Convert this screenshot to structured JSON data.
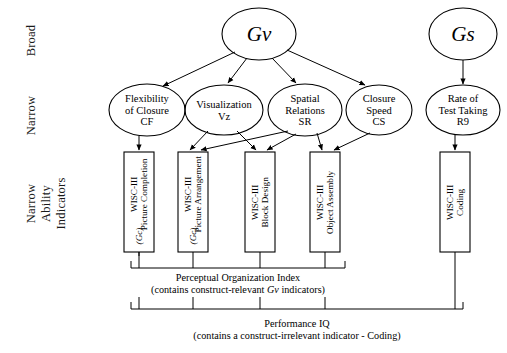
{
  "figure": {
    "type": "hierarchical-factor-diagram",
    "width": 507,
    "height": 353,
    "background": "#ffffff",
    "line_color": "#000000"
  },
  "layer_labels": [
    {
      "id": "broad",
      "text": "Broad"
    },
    {
      "id": "narrow",
      "text": "Narrow"
    },
    {
      "id": "indicators_line1",
      "text": "Narrow"
    },
    {
      "id": "indicators_line2",
      "text": "Ability"
    },
    {
      "id": "indicators_line3",
      "text": "Indicators"
    }
  ],
  "broad_factors": [
    {
      "id": "gv",
      "label": "Gv",
      "cx": 259,
      "cy": 34,
      "rx": 37,
      "ry": 26
    },
    {
      "id": "gs",
      "label": "Gs",
      "cx": 463,
      "cy": 34,
      "rx": 34,
      "ry": 26
    }
  ],
  "narrow_factors": [
    {
      "id": "cf",
      "lines": [
        "Flexibility",
        "of Closure",
        "CF"
      ],
      "cx": 147,
      "cy": 110,
      "rx": 38,
      "ry": 26
    },
    {
      "id": "vz",
      "lines": [
        "Visualization",
        "Vz"
      ],
      "cx": 224,
      "cy": 110,
      "rx": 39,
      "ry": 25
    },
    {
      "id": "sr",
      "lines": [
        "Spatial",
        "Relations",
        "SR"
      ],
      "cx": 305,
      "cy": 110,
      "rx": 37,
      "ry": 26
    },
    {
      "id": "cs",
      "lines": [
        "Closure",
        "Speed",
        "CS"
      ],
      "cx": 379,
      "cy": 110,
      "rx": 33,
      "ry": 25
    },
    {
      "id": "r9",
      "lines": [
        "Rate of",
        "Test Taking",
        "R9"
      ],
      "cx": 463,
      "cy": 110,
      "rx": 37,
      "ry": 25
    }
  ],
  "indicator_boxes": [
    {
      "id": "picture-completion",
      "line1": "WISC-III",
      "line2": "Picture Completion",
      "note": "(Gc)",
      "x": 124,
      "y": 152,
      "w": 30,
      "h": 100
    },
    {
      "id": "picture-arrangement",
      "line1": "WISC-III",
      "line2": "Picture Arrangement",
      "note": "(Gc)",
      "x": 178,
      "y": 152,
      "w": 30,
      "h": 100
    },
    {
      "id": "block-design",
      "line1": "WISC-III",
      "line2": "Block Design",
      "note": "",
      "x": 245,
      "y": 152,
      "w": 30,
      "h": 100
    },
    {
      "id": "object-assembly",
      "line1": "WISC-III",
      "line2": "Object Assembly",
      "note": "",
      "x": 310,
      "y": 152,
      "w": 30,
      "h": 100
    },
    {
      "id": "coding",
      "line1": "WISC-III",
      "line2": "Coding",
      "note": "",
      "x": 440,
      "y": 152,
      "w": 30,
      "h": 100
    }
  ],
  "brackets": [
    {
      "id": "perceptual-organization-index",
      "caption_line1": "Perceptual Organization Index",
      "caption_line2_pre": "(contains construct-relevant ",
      "caption_line2_em": "Gv",
      "caption_line2_post": " indicators)",
      "x1": 131,
      "x2": 345,
      "y": 268,
      "ticks": [
        139,
        193,
        260,
        325
      ]
    },
    {
      "id": "performance-iq",
      "caption_line1": "Performance  IQ",
      "caption_line2_pre": "(contains a construct-irrelevant indicator - Coding)",
      "caption_line2_em": "",
      "caption_line2_post": "",
      "x1": 131,
      "x2": 463,
      "y": 309,
      "ticks": [
        139,
        193,
        260,
        325,
        455
      ]
    }
  ],
  "edges": [
    {
      "from": "gv",
      "to": "cf"
    },
    {
      "from": "gv",
      "to": "vz"
    },
    {
      "from": "gv",
      "to": "sr"
    },
    {
      "from": "gv",
      "to": "cs"
    },
    {
      "from": "gs",
      "to": "r9"
    },
    {
      "from": "cf",
      "to": "picture-completion"
    },
    {
      "from": "vz",
      "to": "picture-arrangement"
    },
    {
      "from": "vz",
      "to": "block-design"
    },
    {
      "from": "sr",
      "to": "picture-arrangement"
    },
    {
      "from": "sr",
      "to": "block-design"
    },
    {
      "from": "sr",
      "to": "object-assembly"
    },
    {
      "from": "cs",
      "to": "object-assembly"
    },
    {
      "from": "r9",
      "to": "coding"
    }
  ]
}
